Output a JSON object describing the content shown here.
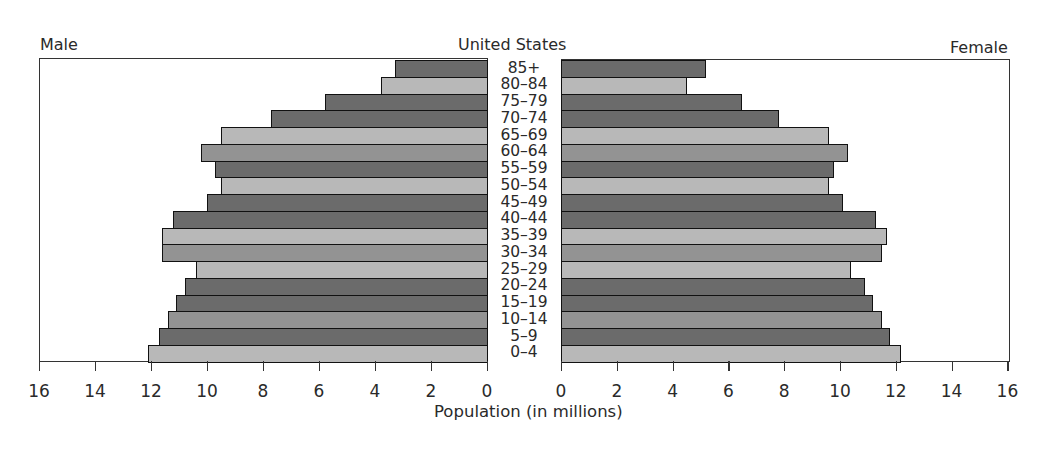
{
  "chart_data": {
    "type": "bar",
    "subtype": "population-pyramid",
    "title": "United States",
    "left_label": "Male",
    "right_label": "Female",
    "xlabel": "Population (in millions)",
    "ylabel": "",
    "xlim": [
      0,
      16
    ],
    "x_ticks": [
      0,
      2,
      4,
      6,
      8,
      10,
      12,
      14,
      16
    ],
    "grid": false,
    "legend": "none",
    "categories": [
      "85+",
      "80–84",
      "75–79",
      "70–74",
      "65–69",
      "60–64",
      "55–59",
      "50–54",
      "45–49",
      "40–44",
      "35–39",
      "30–34",
      "25–29",
      "20–24",
      "15–19",
      "10–14",
      "5–9",
      "0–4"
    ],
    "series": [
      {
        "name": "Male",
        "values": [
          3.3,
          3.8,
          5.8,
          7.7,
          9.5,
          10.2,
          9.7,
          9.5,
          10.0,
          11.2,
          11.6,
          11.6,
          10.4,
          10.8,
          11.1,
          11.4,
          11.7,
          12.1
        ]
      },
      {
        "name": "Female",
        "values": [
          5.2,
          4.5,
          6.5,
          7.8,
          9.6,
          10.3,
          9.8,
          9.6,
          10.1,
          11.3,
          11.7,
          11.5,
          10.4,
          10.9,
          11.2,
          11.5,
          11.8,
          12.2
        ]
      }
    ],
    "bar_shades": [
      "dark",
      "light",
      "dark",
      "dark",
      "light",
      "medium",
      "dark",
      "light",
      "dark",
      "dark",
      "light",
      "medium",
      "light",
      "dark",
      "dark",
      "medium",
      "dark",
      "light"
    ]
  },
  "colors": {
    "dark": "#6b6b6b",
    "medium": "#939393",
    "light": "#b8b8b8",
    "outline": "#111111"
  }
}
